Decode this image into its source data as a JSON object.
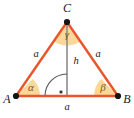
{
  "diagram": {
    "type": "isosceles-triangle-with-altitude",
    "colors": {
      "side_stroke": "#E8562A",
      "base_stroke": "#E8562A",
      "angle_fill": "#FBD89A",
      "angle_fill_apex": "#FBD89A",
      "altitude_stroke": "#8C8C8C",
      "right_angle_stroke": "#555555",
      "vertex_dot": "#141414",
      "label_text": "#1a1a1a",
      "angle_text": "#7a5a10",
      "background": "#ffffff"
    },
    "vertices": [
      {
        "name": "vertex-a",
        "label": "A",
        "x": 16,
        "y": 96,
        "label_x": 7,
        "label_y": 100
      },
      {
        "name": "vertex-b",
        "label": "B",
        "x": 118,
        "y": 96,
        "label_x": 127,
        "label_y": 100
      },
      {
        "name": "vertex-c",
        "label": "C",
        "x": 67,
        "y": 22,
        "label_x": 67,
        "label_y": 9
      }
    ],
    "sides": [
      {
        "name": "side-ac",
        "label": "a",
        "label_x": 36,
        "label_y": 55
      },
      {
        "name": "side-bc",
        "label": "a",
        "label_x": 98,
        "label_y": 55
      },
      {
        "name": "side-ab",
        "label": "a",
        "label_x": 67,
        "label_y": 108
      }
    ],
    "angles": [
      {
        "name": "angle-alpha",
        "label": "α",
        "vertex": "A",
        "label_x": 31,
        "label_y": 88
      },
      {
        "name": "angle-beta",
        "label": "β",
        "vertex": "B",
        "label_x": 103,
        "label_y": 88
      },
      {
        "name": "angle-gamma",
        "label": "γ",
        "vertex": "C",
        "label_x": 67,
        "label_y": 35
      }
    ],
    "altitude": {
      "name": "altitude-h",
      "label": "h",
      "label_x": 76,
      "label_y": 62,
      "foot_x": 67,
      "foot_y": 96,
      "top_x": 67,
      "top_y": 22
    },
    "right_angle": {
      "name": "right-angle-marker",
      "marker": "·",
      "dot_x": 61,
      "dot_y": 92
    }
  }
}
